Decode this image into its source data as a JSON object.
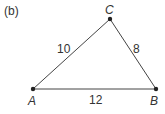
{
  "figure": {
    "panel_label": "(b)",
    "vertices": [
      {
        "name": "A",
        "x": 33,
        "y": 89
      },
      {
        "name": "B",
        "x": 156,
        "y": 89
      },
      {
        "name": "C",
        "x": 110,
        "y": 19
      }
    ],
    "sides": [
      {
        "from": "A",
        "to": "C",
        "length_label": "10"
      },
      {
        "from": "C",
        "to": "B",
        "length_label": "8"
      },
      {
        "from": "A",
        "to": "B",
        "length_label": "12"
      }
    ],
    "colors": {
      "line": "#444444",
      "point": "#222222",
      "text": "#333333"
    }
  }
}
